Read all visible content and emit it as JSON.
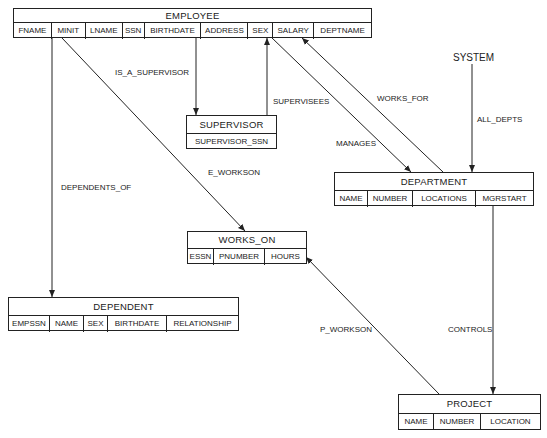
{
  "diagram": {
    "type": "database-schema-diagram",
    "tables": {
      "employee": {
        "name": "EMPLOYEE",
        "fields": [
          "FNAME",
          "MINIT",
          "LNAME",
          "SSN",
          "BIRTHDATE",
          "ADDRESS",
          "SEX",
          "SALARY",
          "DEPTNAME"
        ]
      },
      "supervisor": {
        "name": "SUPERVISOR",
        "fields": [
          "SUPERVISOR_SSN"
        ]
      },
      "department": {
        "name": "DEPARTMENT",
        "fields": [
          "NAME",
          "NUMBER",
          "LOCATIONS",
          "MGRSTART"
        ]
      },
      "works_on": {
        "name": "WORKS_ON",
        "fields": [
          "ESSN",
          "PNUMBER",
          "HOURS"
        ]
      },
      "dependent": {
        "name": "DEPENDENT",
        "fields": [
          "EMPSSN",
          "NAME",
          "SEX",
          "BIRTHDATE",
          "RELATIONSHIP"
        ]
      },
      "project": {
        "name": "PROJECT",
        "fields": [
          "NAME",
          "NUMBER",
          "LOCATION"
        ]
      }
    },
    "system": {
      "name": "SYSTEM"
    },
    "relationships": {
      "is_a_supervisor": "IS_A_SUPERVISOR",
      "supervisees": "SUPERVISEES",
      "works_for": "WORKS_FOR",
      "all_depts": "ALL_DEPTS",
      "manages": "MANAGES",
      "e_workson": "E_WORKSON",
      "dependents_of": "DEPENDENTS_OF",
      "p_workson": "P_WORKSON",
      "controls": "CONTROLS"
    },
    "colors": {
      "line": "#222222",
      "background": "#ffffff",
      "text": "#1a1a1a"
    }
  }
}
